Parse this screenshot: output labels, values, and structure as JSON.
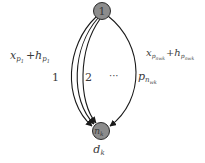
{
  "diagram": {
    "colors": {
      "node_fill": "#8c8c8c",
      "node_stroke": "#2a2a2a",
      "edge": "#1a1a1a",
      "text": "#3a3a3a",
      "background": "#ffffff"
    },
    "nodes": [
      {
        "id": "source",
        "label": "1"
      },
      {
        "id": "dest",
        "label": "n_k",
        "label_main": "n",
        "label_sub": "k",
        "below_label_main": "d",
        "below_label_sub": "k"
      }
    ],
    "paths": [
      {
        "id": "path-1",
        "index_label": "1"
      },
      {
        "id": "path-2",
        "index_label": "2"
      },
      {
        "id": "path-ellipsis",
        "index_label": "···"
      },
      {
        "id": "path-last",
        "index_label_main": "p",
        "index_label_sub": "n",
        "index_label_subsub": "wk"
      }
    ],
    "left_formula": {
      "x": "x",
      "x_sub": "p",
      "x_subsub": "1",
      "plus": "+",
      "h": "h",
      "h_sub": "p",
      "h_subsub": "1"
    },
    "right_formula": {
      "x": "x",
      "x_sub": "p",
      "x_subsub": "nwk",
      "plus": "+",
      "h": "h",
      "h_sub": "p",
      "h_subsub": "nwk"
    }
  }
}
